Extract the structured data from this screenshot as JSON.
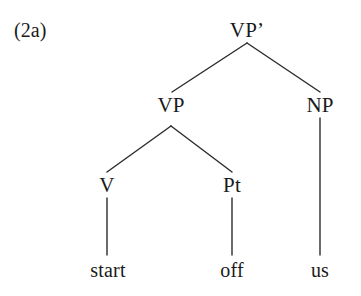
{
  "figure": {
    "example_number": "(2a)",
    "background_color": "#ffffff",
    "ink_color": "#1a1a1a"
  },
  "tree": {
    "nodes": {
      "root": {
        "label": "VP’",
        "x": 247,
        "y": 20
      },
      "vp": {
        "label": "VP",
        "x": 171,
        "y": 95
      },
      "np": {
        "label": "NP",
        "x": 320,
        "y": 95
      },
      "v": {
        "label": "V",
        "x": 107,
        "y": 175
      },
      "pt": {
        "label": "Pt",
        "x": 232,
        "y": 175
      }
    },
    "leaves": {
      "start": {
        "label": "start",
        "x": 108,
        "y": 260
      },
      "off": {
        "label": "off",
        "x": 232,
        "y": 260
      },
      "us": {
        "label": "us",
        "x": 320,
        "y": 260
      }
    },
    "edges": [
      {
        "name": "root-to-vp",
        "x1": 247,
        "y1": 43,
        "x2": 172,
        "y2": 92
      },
      {
        "name": "root-to-np",
        "x1": 247,
        "y1": 43,
        "x2": 320,
        "y2": 92
      },
      {
        "name": "vp-to-v",
        "x1": 171,
        "y1": 126,
        "x2": 107,
        "y2": 172
      },
      {
        "name": "vp-to-pt",
        "x1": 171,
        "y1": 126,
        "x2": 232,
        "y2": 172
      },
      {
        "name": "np-to-us",
        "x1": 320,
        "y1": 118,
        "x2": 320,
        "y2": 255
      },
      {
        "name": "v-to-start",
        "x1": 107,
        "y1": 198,
        "x2": 107,
        "y2": 255
      },
      {
        "name": "pt-to-off",
        "x1": 232,
        "y1": 198,
        "x2": 232,
        "y2": 255
      }
    ]
  }
}
